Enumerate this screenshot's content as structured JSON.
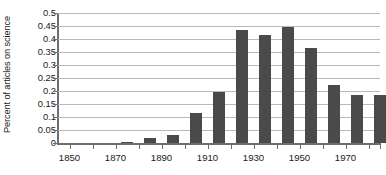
{
  "chart_data": {
    "type": "bar",
    "title": "",
    "xlabel": "",
    "ylabel": "Percent of articles on science",
    "ylim": [
      0,
      0.5
    ],
    "xlim": [
      1845,
      1985
    ],
    "grid": true,
    "legend": false,
    "y_ticks": [
      "0.5",
      "0.45",
      "0.4",
      "0.35",
      "0.3",
      "0.25",
      "0.2",
      "0.15",
      "0.1",
      "0.05",
      "0"
    ],
    "y_tick_values": [
      0.5,
      0.45,
      0.4,
      0.35,
      0.3,
      0.25,
      0.2,
      0.15,
      0.1,
      0.05,
      0
    ],
    "x_tick_labels": [
      "1850",
      "1870",
      "1890",
      "1910",
      "1930",
      "1950",
      "1970"
    ],
    "x_tick_values": [
      1850,
      1870,
      1890,
      1910,
      1930,
      1950,
      1970
    ],
    "x_minor_ticks": [
      1860,
      1880,
      1900,
      1920,
      1940,
      1960,
      1980
    ],
    "categories": [
      1850,
      1860,
      1870,
      1880,
      1890,
      1900,
      1910,
      1920,
      1930,
      1940,
      1950,
      1960,
      1970,
      1980
    ],
    "values": [
      0,
      0,
      0.005,
      0.02,
      0.03,
      0.115,
      0.195,
      0.435,
      0.415,
      0.445,
      0.365,
      0.225,
      0.185,
      0.185
    ],
    "bar_color": "#4a4a4a",
    "gridline_color": "#b9b9b9",
    "axis_color": "#6e6e6e"
  }
}
